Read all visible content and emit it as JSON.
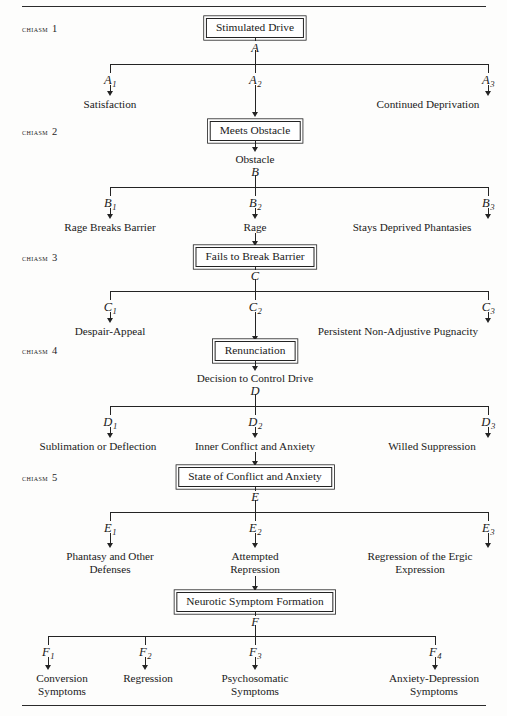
{
  "figure": {
    "kind": "branching-flowchart",
    "title_letters": [
      "A",
      "B",
      "C",
      "D",
      "E",
      "F"
    ],
    "rules": {
      "top_label": "top-rule",
      "bottom_label": "bottom-rule"
    }
  },
  "chiasms": [
    {
      "side_label": "CHIASM",
      "side_number": "1",
      "box": "Stimulated Drive",
      "node_letter": "A",
      "branches": [
        {
          "id": "A",
          "sub": "1",
          "label_line1": "Satisfaction",
          "label_line2": ""
        },
        {
          "id": "A",
          "sub": "2",
          "label_line1": "",
          "label_line2": ""
        },
        {
          "id": "A",
          "sub": "3",
          "label_line1": "Continued Deprivation",
          "label_line2": ""
        }
      ]
    },
    {
      "side_label": "CHIASM",
      "side_number": "2",
      "box": "Meets Obstacle",
      "pre_text": "Obstacle",
      "node_letter": "B",
      "branches": [
        {
          "id": "B",
          "sub": "1",
          "label_line1": "Rage Breaks Barrier",
          "label_line2": ""
        },
        {
          "id": "B",
          "sub": "2",
          "label_line1": "Rage",
          "label_line2": ""
        },
        {
          "id": "B",
          "sub": "3",
          "label_line1": "Stays Deprived Phantasies",
          "label_line2": ""
        }
      ]
    },
    {
      "side_label": "CHIASM",
      "side_number": "3",
      "box": "Fails to Break Barrier",
      "node_letter": "C",
      "branches": [
        {
          "id": "C",
          "sub": "1",
          "label_line1": "Despair-Appeal",
          "label_line2": ""
        },
        {
          "id": "C",
          "sub": "2",
          "label_line1": "",
          "label_line2": ""
        },
        {
          "id": "C",
          "sub": "3",
          "label_line1": "Persistent Non-Adjustive Pugnacity",
          "label_line2": ""
        }
      ]
    },
    {
      "side_label": "CHIASM",
      "side_number": "4",
      "box": "Renunciation",
      "pre_text": "Decision to Control Drive",
      "node_letter": "D",
      "branches": [
        {
          "id": "D",
          "sub": "1",
          "label_line1": "Sublimation or Deflection",
          "label_line2": ""
        },
        {
          "id": "D",
          "sub": "2",
          "label_line1": "Inner Conflict and Anxiety",
          "label_line2": ""
        },
        {
          "id": "D",
          "sub": "3",
          "label_line1": "Willed Suppression",
          "label_line2": ""
        }
      ]
    },
    {
      "side_label": "CHIASM",
      "side_number": "5",
      "box": "State of Conflict and Anxiety",
      "node_letter": "E",
      "branches": [
        {
          "id": "E",
          "sub": "1",
          "label_line1": "Phantasy and Other",
          "label_line2": "Defenses"
        },
        {
          "id": "E",
          "sub": "2",
          "label_line1": "Attempted",
          "label_line2": "Repression"
        },
        {
          "id": "E",
          "sub": "3",
          "label_line1": "Regression of the Ergic",
          "label_line2": "Expression"
        }
      ]
    },
    {
      "side_label": "",
      "side_number": "",
      "box": "Neurotic Symptom Formation",
      "node_letter": "F",
      "branches": [
        {
          "id": "F",
          "sub": "1",
          "label_line1": "Conversion",
          "label_line2": "Symptoms"
        },
        {
          "id": "F",
          "sub": "2",
          "label_line1": "Regression",
          "label_line2": ""
        },
        {
          "id": "F",
          "sub": "3",
          "label_line1": "Psychosomatic",
          "label_line2": "Symptoms"
        },
        {
          "id": "F",
          "sub": "4",
          "label_line1": "Anxiety-Depression",
          "label_line2": "Symptoms"
        }
      ]
    }
  ]
}
